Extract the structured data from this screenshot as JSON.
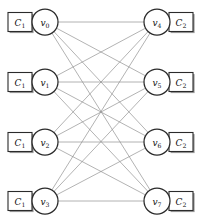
{
  "figure": {
    "type": "bipartite-graph",
    "width": 197,
    "height": 219,
    "background": "#ffffff",
    "caption": "",
    "caption_visible": false
  },
  "colors": {
    "edge": "#8a8a8a",
    "node_stroke": "#2b2b2b",
    "node_fill": "#ffffff",
    "box_stroke": "#2b2b2b",
    "box_shadow": "#9a9a9a",
    "text": "#111111"
  },
  "geometry": {
    "node_radius": 13,
    "box_width": 24,
    "box_height": 19,
    "left_column_x": 45,
    "right_column_x": 157,
    "row_y": [
      22,
      82,
      142,
      201
    ]
  },
  "graph_data": {
    "type": "bipartite",
    "left_partition": "C1",
    "right_partition": "C2",
    "nodes": [
      {
        "id": "v0",
        "label": "v",
        "sub": "0",
        "side": "left",
        "cx": 45,
        "cy": 22,
        "cluster": "C1"
      },
      {
        "id": "v1",
        "label": "v",
        "sub": "1",
        "side": "left",
        "cx": 45,
        "cy": 82,
        "cluster": "C1"
      },
      {
        "id": "v2",
        "label": "v",
        "sub": "2",
        "side": "left",
        "cx": 45,
        "cy": 142,
        "cluster": "C1"
      },
      {
        "id": "v3",
        "label": "v",
        "sub": "3",
        "side": "left",
        "cx": 45,
        "cy": 201,
        "cluster": "C1"
      },
      {
        "id": "v4",
        "label": "v",
        "sub": "4",
        "side": "right",
        "cx": 157,
        "cy": 22,
        "cluster": "C2"
      },
      {
        "id": "v5",
        "label": "v",
        "sub": "5",
        "side": "right",
        "cx": 157,
        "cy": 82,
        "cluster": "C2"
      },
      {
        "id": "v6",
        "label": "v",
        "sub": "6",
        "side": "right",
        "cx": 157,
        "cy": 142,
        "cluster": "C2"
      },
      {
        "id": "v7",
        "label": "v",
        "sub": "7",
        "side": "right",
        "cx": 157,
        "cy": 201,
        "cluster": "C2"
      }
    ],
    "clusters": [
      {
        "id": "c1-v0",
        "label": "C",
        "sub": "1",
        "side": "left",
        "attached_to": "v0",
        "cx": 20,
        "cy": 22
      },
      {
        "id": "c1-v1",
        "label": "C",
        "sub": "1",
        "side": "left",
        "attached_to": "v1",
        "cx": 20,
        "cy": 82
      },
      {
        "id": "c1-v2",
        "label": "C",
        "sub": "1",
        "side": "left",
        "attached_to": "v2",
        "cx": 20,
        "cy": 142
      },
      {
        "id": "c1-v3",
        "label": "C",
        "sub": "1",
        "side": "left",
        "attached_to": "v3",
        "cx": 20,
        "cy": 201
      },
      {
        "id": "c2-v4",
        "label": "C",
        "sub": "2",
        "side": "right",
        "attached_to": "v4",
        "cx": 181,
        "cy": 22
      },
      {
        "id": "c2-v5",
        "label": "C",
        "sub": "2",
        "side": "right",
        "attached_to": "v5",
        "cx": 181,
        "cy": 82
      },
      {
        "id": "c2-v6",
        "label": "C",
        "sub": "2",
        "side": "right",
        "attached_to": "v6",
        "cx": 181,
        "cy": 142
      },
      {
        "id": "c2-v7",
        "label": "C",
        "sub": "2",
        "side": "right",
        "attached_to": "v7",
        "cx": 181,
        "cy": 201
      }
    ],
    "edges": [
      {
        "from": "v0",
        "to": "v4"
      },
      {
        "from": "v0",
        "to": "v5"
      },
      {
        "from": "v0",
        "to": "v6"
      },
      {
        "from": "v0",
        "to": "v7"
      },
      {
        "from": "v1",
        "to": "v4"
      },
      {
        "from": "v1",
        "to": "v5"
      },
      {
        "from": "v1",
        "to": "v6"
      },
      {
        "from": "v1",
        "to": "v7"
      },
      {
        "from": "v2",
        "to": "v4"
      },
      {
        "from": "v2",
        "to": "v5"
      },
      {
        "from": "v2",
        "to": "v6"
      },
      {
        "from": "v2",
        "to": "v7"
      },
      {
        "from": "v3",
        "to": "v4"
      },
      {
        "from": "v3",
        "to": "v5"
      },
      {
        "from": "v3",
        "to": "v6"
      },
      {
        "from": "v3",
        "to": "v7"
      }
    ],
    "edge_count": 16,
    "node_count": 8
  }
}
